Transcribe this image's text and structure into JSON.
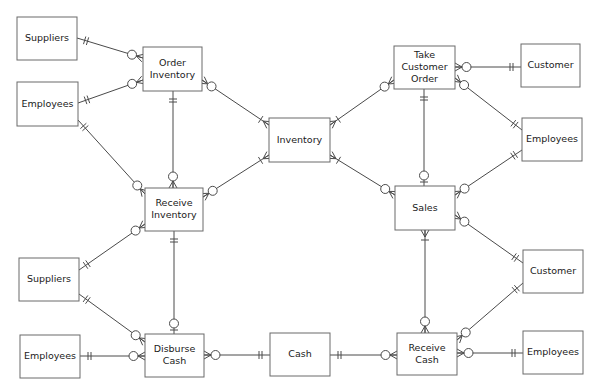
{
  "diagram": {
    "title_cut": "",
    "entities": [
      {
        "id": "suppliers1",
        "lines": [
          "Suppliers"
        ],
        "x": 17,
        "y": 17,
        "w": 60,
        "h": 43
      },
      {
        "id": "employees1",
        "lines": [
          "Employees"
        ],
        "x": 17,
        "y": 82,
        "w": 61,
        "h": 44
      },
      {
        "id": "order_inventory",
        "lines": [
          "Order",
          "Inventory"
        ],
        "x": 143,
        "y": 47,
        "w": 59,
        "h": 44
      },
      {
        "id": "inventory",
        "lines": [
          "Inventory"
        ],
        "x": 269,
        "y": 118,
        "w": 61,
        "h": 44
      },
      {
        "id": "take_customer_order",
        "lines": [
          "Take",
          "Customer",
          "Order"
        ],
        "x": 394,
        "y": 46,
        "w": 61,
        "h": 43
      },
      {
        "id": "customer1",
        "lines": [
          "Customer"
        ],
        "x": 521,
        "y": 44,
        "w": 59,
        "h": 43
      },
      {
        "id": "employees2",
        "lines": [
          "Employees"
        ],
        "x": 522,
        "y": 118,
        "w": 60,
        "h": 43
      },
      {
        "id": "receive_inventory",
        "lines": [
          "Receive",
          "Inventory"
        ],
        "x": 145,
        "y": 188,
        "w": 58,
        "h": 43
      },
      {
        "id": "sales",
        "lines": [
          "Sales"
        ],
        "x": 395,
        "y": 186,
        "w": 60,
        "h": 44
      },
      {
        "id": "suppliers2",
        "lines": [
          "Suppliers"
        ],
        "x": 19,
        "y": 258,
        "w": 60,
        "h": 43
      },
      {
        "id": "customer2",
        "lines": [
          "Customer"
        ],
        "x": 523,
        "y": 250,
        "w": 60,
        "h": 43
      },
      {
        "id": "employees3",
        "lines": [
          "Employees"
        ],
        "x": 20,
        "y": 335,
        "w": 60,
        "h": 43
      },
      {
        "id": "disburse_cash",
        "lines": [
          "Disburse",
          "Cash"
        ],
        "x": 145,
        "y": 334,
        "w": 59,
        "h": 43
      },
      {
        "id": "cash",
        "lines": [
          "Cash"
        ],
        "x": 270,
        "y": 333,
        "w": 60,
        "h": 43
      },
      {
        "id": "receive_cash",
        "lines": [
          "Receive",
          "Cash"
        ],
        "x": 397,
        "y": 333,
        "w": 60,
        "h": 42
      },
      {
        "id": "employees4",
        "lines": [
          "Employees"
        ],
        "x": 523,
        "y": 331,
        "w": 60,
        "h": 43
      }
    ],
    "relationships": [
      {
        "from": [
          77,
          38
        ],
        "to": [
          143,
          58
        ],
        "from_card": "one-mandatory",
        "to_card": "zero-many"
      },
      {
        "from": [
          78,
          103
        ],
        "to": [
          143,
          80
        ],
        "from_card": "one-mandatory",
        "to_card": "zero-many"
      },
      {
        "from": [
          78,
          120
        ],
        "to": [
          145,
          194
        ],
        "from_card": "one-mandatory",
        "to_card": "zero-many"
      },
      {
        "from": [
          173,
          91
        ],
        "to": [
          173,
          188
        ],
        "from_card": "one-mandatory",
        "to_card": "zero-many"
      },
      {
        "from": [
          202,
          80
        ],
        "to": [
          269,
          125
        ],
        "from_card": "zero-many",
        "to_card": "one-many"
      },
      {
        "from": [
          203,
          197
        ],
        "to": [
          269,
          155
        ],
        "from_card": "zero-many",
        "to_card": "one-many"
      },
      {
        "from": [
          394,
          80
        ],
        "to": [
          330,
          125
        ],
        "from_card": "zero-many",
        "to_card": "one-many"
      },
      {
        "from": [
          395,
          195
        ],
        "to": [
          330,
          155
        ],
        "from_card": "zero-many",
        "to_card": "one-many"
      },
      {
        "from": [
          521,
          67
        ],
        "to": [
          455,
          67
        ],
        "from_card": "one-mandatory",
        "to_card": "zero-many"
      },
      {
        "from": [
          522,
          130
        ],
        "to": [
          455,
          78
        ],
        "from_card": "one-mandatory",
        "to_card": "zero-many"
      },
      {
        "from": [
          522,
          150
        ],
        "to": [
          455,
          195
        ],
        "from_card": "one-mandatory",
        "to_card": "zero-many"
      },
      {
        "from": [
          424,
          89
        ],
        "to": [
          424,
          186
        ],
        "from_card": "one-mandatory",
        "to_card": "zero-one"
      },
      {
        "from": [
          79,
          270
        ],
        "to": [
          145,
          224
        ],
        "from_card": "one-mandatory",
        "to_card": "zero-many"
      },
      {
        "from": [
          174,
          231
        ],
        "to": [
          174,
          334
        ],
        "from_card": "one-mandatory",
        "to_card": "zero-one"
      },
      {
        "from": [
          79,
          294
        ],
        "to": [
          145,
          342
        ],
        "from_card": "one-mandatory",
        "to_card": "zero-many"
      },
      {
        "from": [
          80,
          356
        ],
        "to": [
          145,
          356
        ],
        "from_card": "one-mandatory",
        "to_card": "zero-many"
      },
      {
        "from": [
          270,
          355
        ],
        "to": [
          204,
          355
        ],
        "from_card": "one-mandatory",
        "to_card": "zero-many"
      },
      {
        "from": [
          330,
          355
        ],
        "to": [
          397,
          355
        ],
        "from_card": "one-mandatory",
        "to_card": "zero-many"
      },
      {
        "from": [
          425,
          230
        ],
        "to": [
          425,
          333
        ],
        "from_card": "one-many",
        "to_card": "zero-many"
      },
      {
        "from": [
          523,
          263
        ],
        "to": [
          455,
          215
        ],
        "from_card": "one-mandatory",
        "to_card": "zero-many"
      },
      {
        "from": [
          523,
          283
        ],
        "to": [
          457,
          340
        ],
        "from_card": "one-mandatory",
        "to_card": "zero-many"
      },
      {
        "from": [
          523,
          353
        ],
        "to": [
          457,
          353
        ],
        "from_card": "one-mandatory",
        "to_card": "zero-many"
      }
    ]
  },
  "colors": {
    "line": "#4a4a4a",
    "box_border": "#6a6a6a",
    "text": "#1a1a1a",
    "background": "#ffffff"
  }
}
